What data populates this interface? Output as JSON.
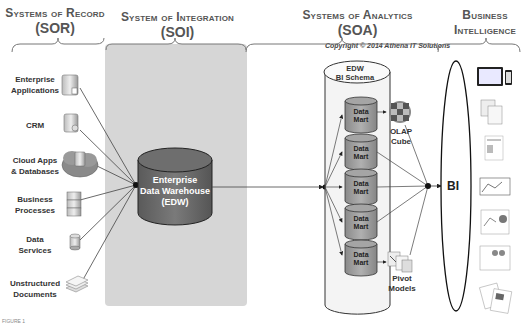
{
  "headers": {
    "sor": {
      "title": "Systems of Record",
      "abbr": "(SOR)"
    },
    "soi": {
      "title": "System of Integration",
      "abbr": "(SOI)"
    },
    "soa": {
      "title": "Systems of Analytics",
      "abbr": "(SOA)"
    },
    "bi": {
      "title_line1": "Business",
      "title_line2": "Intelligence"
    }
  },
  "copyright": "Copyright © 2014 Athena IT Solutions",
  "sources": [
    {
      "label_line1": "Enterprise",
      "label_line2": "Applications",
      "icon": "server-icon"
    },
    {
      "label_line1": "CRM",
      "label_line2": "",
      "icon": "server-icon"
    },
    {
      "label_line1": "Cloud Apps",
      "label_line2": "& Databases",
      "icon": "cloud-server-icon"
    },
    {
      "label_line1": "Business",
      "label_line2": "Processes",
      "icon": "stacked-servers-icon"
    },
    {
      "label_line1": "Data",
      "label_line2": "Services",
      "icon": "database-icon"
    },
    {
      "label_line1": "Unstructured",
      "label_line2": "Documents",
      "icon": "documents-icon"
    }
  ],
  "edw": {
    "line1": "Enterprise",
    "line2": "Data Warehouse",
    "line3": "(EDW)"
  },
  "bi_schema": {
    "line1": "EDW",
    "line2": "BI Schema"
  },
  "data_marts": [
    {
      "line1": "Data",
      "line2": "Mart"
    },
    {
      "line1": "Data",
      "line2": "Mart"
    },
    {
      "line1": "Data",
      "line2": "Mart"
    },
    {
      "line1": "Data",
      "line2": "Mart"
    },
    {
      "line1": "Data",
      "line2": "Mart"
    }
  ],
  "olap": {
    "line1": "OLAP",
    "line2": "Cube"
  },
  "pivot": {
    "line1": "Pivot",
    "line2": "Models"
  },
  "bi_label": "BI",
  "bi_outputs": [
    "tablet-phone-dashboard-icon",
    "spreadsheet-icon",
    "report-icon",
    "chart-dashboard-icon",
    "analytics-dashboard-icon",
    "scorecard-icon",
    "printed-reports-icon"
  ],
  "footer": "FIGURE 1"
}
